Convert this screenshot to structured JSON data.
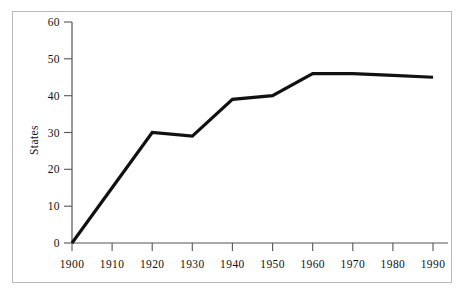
{
  "figure": {
    "background_color": "#ffffff",
    "frame_color": "#b9b9b9",
    "line_color": "#111111",
    "axis_color": "#555555",
    "text_color": "#111111"
  },
  "axes": {
    "y_title": "States",
    "x_title": "",
    "y_ticks": [
      "0",
      "10",
      "20",
      "30",
      "40",
      "50",
      "60"
    ],
    "x_ticks": [
      "1900",
      "1910",
      "1920",
      "1930",
      "1940",
      "1950",
      "1960",
      "1970",
      "1980",
      "1990"
    ]
  },
  "chart_data": {
    "type": "line",
    "title": "",
    "xlabel": "",
    "ylabel": "States",
    "x": [
      1900,
      1910,
      1920,
      1930,
      1940,
      1950,
      1960,
      1970,
      1980,
      1990
    ],
    "values": [
      0,
      15,
      30,
      29,
      39,
      40,
      46,
      46,
      45.5,
      45
    ],
    "categories": [
      "1900",
      "1910",
      "1920",
      "1930",
      "1940",
      "1950",
      "1960",
      "1970",
      "1980",
      "1990"
    ],
    "xlim": [
      1900,
      1990
    ],
    "ylim": [
      0,
      60
    ],
    "y_tick_values": [
      0,
      10,
      20,
      30,
      40,
      50,
      60
    ],
    "x_tick_values": [
      1900,
      1910,
      1920,
      1930,
      1940,
      1950,
      1960,
      1970,
      1980,
      1990
    ],
    "grid": false,
    "legend": false,
    "legend_position": "none",
    "series": [
      {
        "name": "States",
        "values": [
          0,
          15,
          30,
          29,
          39,
          40,
          46,
          46,
          45.5,
          45
        ]
      }
    ]
  }
}
